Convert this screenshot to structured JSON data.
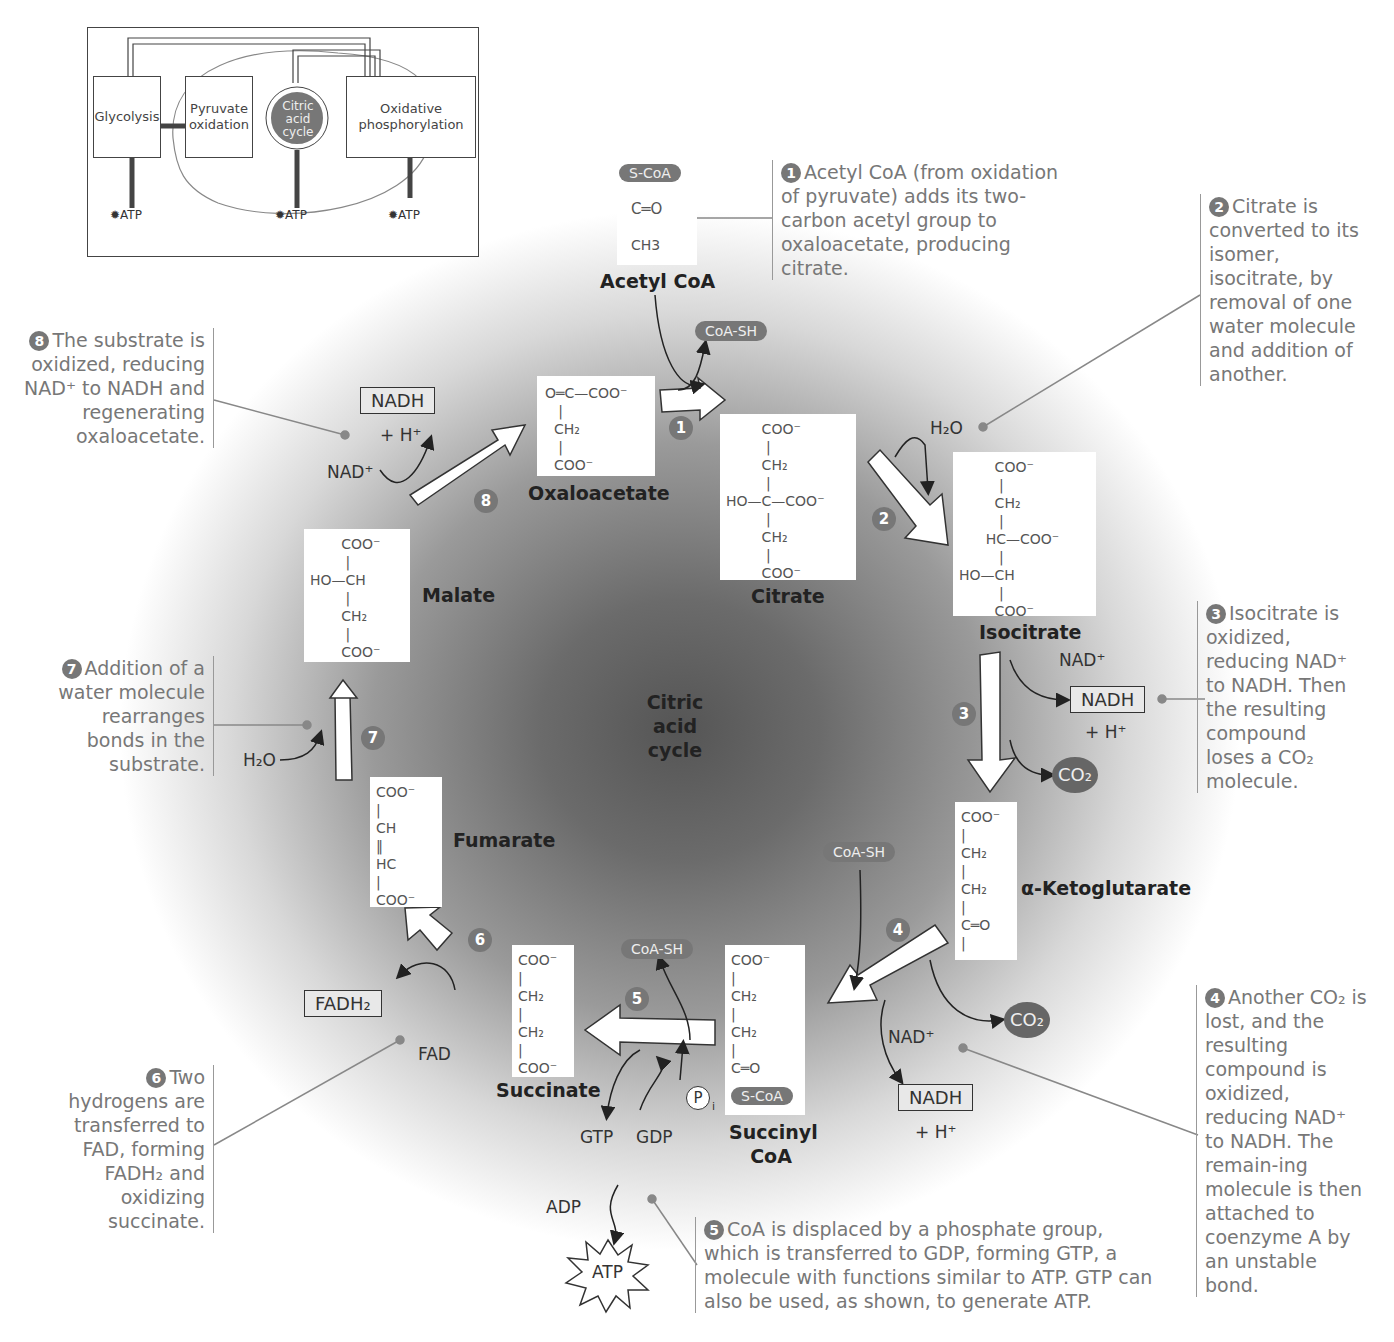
{
  "overview": {
    "boxes": [
      "Glycolysis",
      "Pyruvate oxidation",
      "Citric acid cycle",
      "Oxidative phosphorylation"
    ],
    "atp_labels": [
      "ATP",
      "ATP",
      "ATP"
    ]
  },
  "center_title": [
    "Citric",
    "acid",
    "cycle"
  ],
  "molecules": {
    "acetyl_coa": {
      "name": "Acetyl CoA",
      "structure": [
        "S-CoA",
        "C═O",
        "CH3"
      ]
    },
    "oxaloacetate": {
      "name": "Oxaloacetate",
      "structure": [
        "O═C—COO⁻",
        "   |",
        "  CH₂",
        "   |",
        "  COO⁻"
      ]
    },
    "citrate": {
      "name": "Citrate",
      "structure": [
        "        COO⁻",
        "         |",
        "        CH₂",
        "         |",
        "HO—C—COO⁻",
        "         |",
        "        CH₂",
        "         |",
        "        COO⁻"
      ]
    },
    "isocitrate": {
      "name": "Isocitrate",
      "structure": [
        "        COO⁻",
        "         |",
        "        CH₂",
        "         |",
        "      HC—COO⁻",
        "         |",
        "HO—CH",
        "         |",
        "        COO⁻"
      ]
    },
    "alpha_ketoglutarate": {
      "name": "α-Ketoglutarate",
      "structure": [
        "COO⁻",
        "|",
        "CH₂",
        "|",
        "CH₂",
        "|",
        "C═O",
        "|",
        "COO⁻"
      ]
    },
    "succinyl_coa": {
      "name": "Succinyl CoA",
      "structure": [
        "COO⁻",
        "|",
        "CH₂",
        "|",
        "CH₂",
        "|",
        "C═O",
        "|"
      ],
      "tag": "S-CoA"
    },
    "succinate": {
      "name": "Succinate",
      "structure": [
        "COO⁻",
        "|",
        "CH₂",
        "|",
        "CH₂",
        "|",
        "COO⁻"
      ]
    },
    "fumarate": {
      "name": "Fumarate",
      "structure": [
        "COO⁻",
        "|",
        "CH",
        "‖",
        "HC",
        "|",
        "COO⁻"
      ]
    },
    "malate": {
      "name": "Malate",
      "structure": [
        "       COO⁻",
        "        |",
        "HO—CH",
        "        |",
        "       CH₂",
        "        |",
        "       COO⁻"
      ]
    }
  },
  "steps": [
    "1",
    "2",
    "3",
    "4",
    "5",
    "6",
    "7",
    "8"
  ],
  "cofactors": {
    "coa_sh_1": "CoA-SH",
    "h2o_2": "H₂O",
    "nad_3": "NAD⁺",
    "nadh_3": "NADH",
    "h_3": "+ H⁺",
    "co2_3": "CO₂",
    "coa_sh_4": "CoA-SH",
    "nad_4": "NAD⁺",
    "nadh_4": "NADH",
    "h_4": "+ H⁺",
    "co2_4": "CO₂",
    "coa_sh_5": "CoA-SH",
    "pi_5": "P",
    "pi_sub": "i",
    "gtp": "GTP",
    "gdp": "GDP",
    "adp": "ADP",
    "atp": "ATP",
    "fadh2": "FADH₂",
    "fad": "FAD",
    "h2o_7": "H₂O",
    "nad_8": "NAD⁺",
    "nadh_8": "NADH",
    "h_8": "+ H⁺"
  },
  "notes": {
    "n1": {
      "num": "1",
      "text": "Acetyl CoA (from oxidation of pyruvate) adds its two-carbon acetyl group to oxaloacetate, producing citrate."
    },
    "n2": {
      "num": "2",
      "text": "Citrate is converted to its isomer, isocitrate, by removal of one water molecule and addition of another."
    },
    "n3": {
      "num": "3",
      "text": "Isocitrate is oxidized, reducing NAD⁺ to NADH. Then the resulting compound loses a CO₂ molecule."
    },
    "n4": {
      "num": "4",
      "text": "Another CO₂ is lost, and the resulting compound is oxidized, reducing NAD⁺ to NADH. The remain-ing molecule is then attached to coenzyme A by an unstable bond."
    },
    "n5": {
      "num": "5",
      "text": "CoA is displaced by a phosphate group, which is transferred to GDP, forming GTP, a molecule with functions similar to ATP. GTP can also be used, as shown, to generate ATP."
    },
    "n6": {
      "num": "6",
      "text": "Two hydrogens are transferred to FAD, forming FADH₂ and oxidizing succinate."
    },
    "n7": {
      "num": "7",
      "text": "Addition of a water molecule rearranges bonds in the substrate."
    },
    "n8": {
      "num": "8",
      "text": "The substrate is oxidized, reducing NAD⁺ to NADH and regenerating oxaloacetate."
    }
  }
}
